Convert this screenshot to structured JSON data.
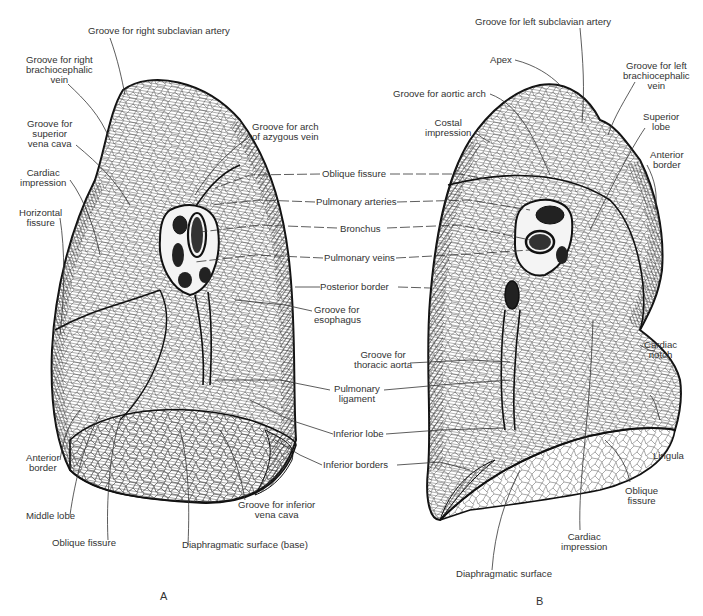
{
  "figure": {
    "panels": [
      {
        "id": "A",
        "label": "A",
        "description": "Right lung, medial view"
      },
      {
        "id": "B",
        "label": "B",
        "description": "Left lung, medial view"
      }
    ],
    "colors": {
      "ink": "#1a1a1a",
      "background": "#ffffff",
      "label_text": "#333333"
    }
  },
  "labels_a": {
    "groove_right_subclavian_artery": "Groove for right subclavian artery",
    "groove_right_brachiocephalic_vein": "Groove for right\nbrachiocephalic\nvein",
    "groove_superior_vena_cava": "Groove for\nsuperior\nvena cava",
    "cardiac_impression": "Cardiac\nimpression",
    "horizontal_fissure": "Horizontal\nfissure",
    "groove_arch_azygous_vein": "Groove for arch\nof azygous vein",
    "anterior_border": "Anterior\nborder",
    "middle_lobe": "Middle lobe",
    "oblique_fissure": "Oblique fissure",
    "diaphragmatic_surface_base": "Diaphragmatic surface (base)",
    "groove_inferior_vena_cava": "Groove for inferior\nvena cava"
  },
  "labels_shared": {
    "oblique_fissure": "Oblique fissure",
    "pulmonary_arteries": "Pulmonary arteries",
    "bronchus": "Bronchus",
    "pulmonary_veins": "Pulmonary veins",
    "posterior_border": "Posterior border",
    "groove_esophagus": "Groove for\nesophagus",
    "groove_thoracic_aorta": "Groove for\nthoracic aorta",
    "pulmonary_ligament": "Pulmonary\nligament",
    "inferior_lobe": "Inferior lobe",
    "inferior_borders": "Inferior borders"
  },
  "labels_b": {
    "groove_left_subclavian_artery": "Groove for left subclavian artery",
    "apex": "Apex",
    "groove_aortic_arch": "Groove for aortic arch",
    "costal_impression": "Costal\nimpression",
    "groove_left_brachiocephalic_vein": "Groove for left\nbrachiocephalic\nvein",
    "superior_lobe": "Superior\nlobe",
    "anterior_border": "Anterior\nborder",
    "cardiac_notch": "Cardiac\nnotch",
    "lingula": "Lingula",
    "oblique_fissure": "Oblique\nfissure",
    "cardiac_impression": "Cardiac\nimpression",
    "diaphragmatic_surface": "Diaphragmatic surface"
  }
}
